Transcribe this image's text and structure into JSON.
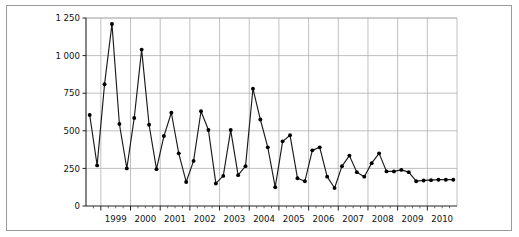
{
  "figure": {
    "background_color": "#ffffff",
    "border_color": "#9a9a9a"
  },
  "chart_data": {
    "type": "line",
    "title": "",
    "subtitle": "",
    "xlabel": "",
    "ylabel": "",
    "legend": [],
    "legend_position": "none",
    "grid": true,
    "grid_color": "#b0b0b0",
    "line_color": "#1a1a1a",
    "marker": "filled-circle",
    "marker_color": "#000000",
    "ylim": [
      0,
      1250
    ],
    "ytick_labels": [
      "0",
      "250",
      "500",
      "750",
      "1 000",
      "1 250"
    ],
    "ytick_values": [
      0,
      250,
      500,
      750,
      1000,
      1250
    ],
    "xlim": [
      1998.5,
      2011.0
    ],
    "xtick_labels": [
      "1999",
      "2000",
      "2001",
      "2002",
      "2003",
      "2004",
      "2005",
      "2006",
      "2007",
      "2008",
      "2009",
      "2010"
    ],
    "xtick_values": [
      1999,
      2000,
      2001,
      2002,
      2003,
      2004,
      2005,
      2006,
      2007,
      2008,
      2009,
      2010
    ],
    "minor_ticks_per_major": 4,
    "x": [
      1998.625,
      1998.875,
      1999.125,
      1999.375,
      1999.625,
      1999.875,
      2000.125,
      2000.375,
      2000.625,
      2000.875,
      2001.125,
      2001.375,
      2001.625,
      2001.875,
      2002.125,
      2002.375,
      2002.625,
      2002.875,
      2003.125,
      2003.375,
      2003.625,
      2003.875,
      2004.125,
      2004.375,
      2004.625,
      2004.875,
      2005.125,
      2005.375,
      2005.625,
      2005.875,
      2006.125,
      2006.375,
      2006.625,
      2006.875,
      2007.125,
      2007.375,
      2007.625,
      2007.875,
      2008.125,
      2008.375,
      2008.625,
      2008.875,
      2009.125,
      2009.375,
      2009.625,
      2009.875,
      2010.125,
      2010.375,
      2010.625,
      2010.875
    ],
    "values": [
      605,
      270,
      810,
      1210,
      545,
      250,
      585,
      1040,
      540,
      245,
      465,
      620,
      350,
      160,
      300,
      630,
      505,
      150,
      200,
      505,
      205,
      265,
      780,
      575,
      390,
      125,
      430,
      470,
      185,
      165,
      370,
      390,
      195,
      120,
      265,
      335,
      225,
      195,
      285,
      350,
      230,
      230,
      240,
      225,
      165,
      170,
      172,
      175,
      175,
      175
    ]
  }
}
